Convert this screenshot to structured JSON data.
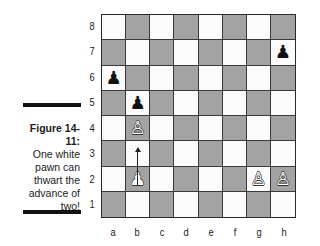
{
  "figure": {
    "label": "Figure 14-11:",
    "caption_lines": [
      "One white",
      "pawn can",
      "thwart the",
      "advance of",
      "two!"
    ]
  },
  "board": {
    "ranks": [
      "8",
      "7",
      "6",
      "5",
      "4",
      "3",
      "2",
      "1"
    ],
    "files": [
      "a",
      "b",
      "c",
      "d",
      "e",
      "f",
      "g",
      "h"
    ],
    "colors": {
      "light": "#fbfbfb",
      "dark": "#a3a3a3",
      "border": "#2a2a2a"
    },
    "pieces": [
      {
        "square": "h7",
        "type": "pawn",
        "color": "black",
        "glyph": "♟"
      },
      {
        "square": "a6",
        "type": "pawn",
        "color": "black",
        "glyph": "♟"
      },
      {
        "square": "b5",
        "type": "pawn",
        "color": "black",
        "glyph": "♟"
      },
      {
        "square": "b4",
        "type": "pawn",
        "color": "white",
        "glyph": "♙"
      },
      {
        "square": "b2",
        "type": "pawn",
        "color": "white",
        "glyph": "♟"
      },
      {
        "square": "g2",
        "type": "pawn",
        "color": "white",
        "glyph": "♙"
      },
      {
        "square": "h2",
        "type": "pawn",
        "color": "white",
        "glyph": "♙"
      }
    ],
    "arrows": [
      {
        "from": "b2",
        "to": "b4"
      }
    ]
  }
}
